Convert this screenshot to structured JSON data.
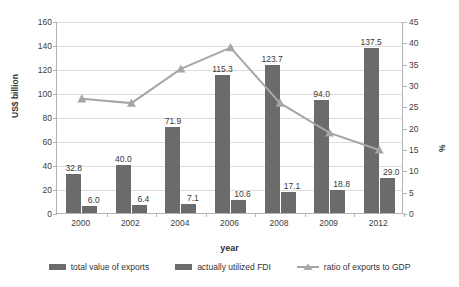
{
  "chart_data": {
    "type": "bar",
    "title": "",
    "xlabel": "year",
    "ylabel": "US$ billion",
    "ylabel_secondary": "%",
    "categories": [
      "2000",
      "2002",
      "2004",
      "2006",
      "2008",
      "2009",
      "2012"
    ],
    "ylim": [
      0,
      160
    ],
    "ylim_secondary": [
      0,
      45
    ],
    "yticks": [
      0,
      20,
      40,
      60,
      80,
      100,
      120,
      140,
      160
    ],
    "yticks_secondary": [
      0,
      5,
      10,
      15,
      20,
      25,
      30,
      35,
      40,
      45
    ],
    "grid": true,
    "legend_position": "bottom",
    "series": [
      {
        "name": "total value of exports",
        "type": "bar",
        "axis": "left",
        "unit": "US$ billion",
        "color": "#6b6b6b",
        "values": [
          32.8,
          40.0,
          71.9,
          115.3,
          123.7,
          94.0,
          137.5
        ],
        "labels": [
          "32.8",
          "40.0",
          "71.9",
          "115.3",
          "123.7",
          "94.0",
          "137.5"
        ]
      },
      {
        "name": "actually utilized FDI",
        "type": "bar",
        "axis": "left",
        "unit": "US$ billion",
        "color": "#6b6b6b",
        "values": [
          6.0,
          6.4,
          7.1,
          10.6,
          17.1,
          18.8,
          29.0
        ],
        "labels": [
          "6.0",
          "6.4",
          "7.1",
          "10.6",
          "17.1",
          "18.8",
          "29.0"
        ]
      },
      {
        "name": "ratio of exports to GDP",
        "type": "line",
        "axis": "right",
        "unit": "%",
        "color": "#a6a6a6",
        "marker": "triangle",
        "values": [
          27.0,
          26.0,
          34.0,
          39.0,
          26.0,
          19.0,
          15.0
        ]
      }
    ]
  },
  "axes": {
    "left": {
      "title": "US$ billion",
      "ticks": [
        "160",
        "140",
        "120",
        "100",
        "80",
        "60",
        "40",
        "20",
        "0"
      ]
    },
    "right": {
      "title": "%",
      "ticks": [
        "45",
        "40",
        "35",
        "30",
        "25",
        "20",
        "15",
        "10",
        "5",
        "0"
      ]
    },
    "bottom": {
      "title": "year",
      "ticks": [
        "2000",
        "2002",
        "2004",
        "2006",
        "2008",
        "2009",
        "2012"
      ]
    }
  },
  "legend": {
    "items": [
      {
        "label": "total value of exports",
        "marker": "swatch",
        "color": "#6b6b6b"
      },
      {
        "label": "actually utilized FDI",
        "marker": "swatch",
        "color": "#6b6b6b"
      },
      {
        "label": "ratio of exports to GDP",
        "marker": "line-triangle",
        "color": "#a6a6a6"
      }
    ]
  }
}
